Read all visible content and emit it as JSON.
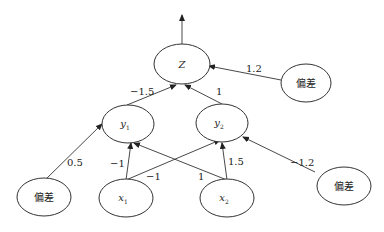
{
  "diagram": {
    "type": "neural-network",
    "nodes": {
      "z": {
        "label": "Z"
      },
      "y1": {
        "label": "y",
        "sub": "1"
      },
      "y2": {
        "label": "y",
        "sub": "2"
      },
      "x1": {
        "label": "x",
        "sub": "1"
      },
      "x2": {
        "label": "x",
        "sub": "2"
      },
      "bias_left": {
        "label": "偏差"
      },
      "bias_top": {
        "label": "偏差"
      },
      "bias_right": {
        "label": "偏差"
      }
    },
    "edges": {
      "y1_z": {
        "from": "y1",
        "to": "z",
        "weight": "−1.5"
      },
      "y2_z": {
        "from": "y2",
        "to": "z",
        "weight": "1"
      },
      "bias_top_z": {
        "from": "bias_top",
        "to": "z",
        "weight": "1.2"
      },
      "bias_left_y1": {
        "from": "bias_left",
        "to": "y1",
        "weight": "0.5"
      },
      "x1_y1": {
        "from": "x1",
        "to": "y1",
        "weight": "−1"
      },
      "x1_y2": {
        "from": "x1",
        "to": "y2",
        "weight": "−1"
      },
      "x2_y1": {
        "from": "x2",
        "to": "y1",
        "weight": "1"
      },
      "x2_y2": {
        "from": "x2",
        "to": "y2",
        "weight": "1.5"
      },
      "bias_right_y2": {
        "from": "bias_right",
        "to": "y2",
        "weight": "−1.2"
      },
      "z_out": {
        "from": "z",
        "to": "output",
        "weight": ""
      }
    }
  }
}
